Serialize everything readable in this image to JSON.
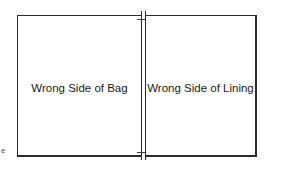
{
  "diagram": {
    "panels": [
      {
        "label": "Wrong Side of Bag"
      },
      {
        "label": "Wrong Side of Lining"
      }
    ],
    "edge_mark": "e",
    "colors": {
      "line": "#2a2a2a",
      "background": "#ffffff",
      "text": "#1a1a1a"
    }
  }
}
